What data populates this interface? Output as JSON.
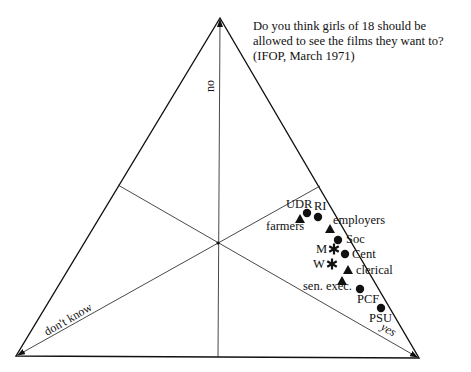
{
  "chart_data": {
    "type": "scatter",
    "subtype": "ternary",
    "title": "Do you think girls of 18 should be allowed to see the films they want to? (IFOP, March 1971)",
    "title_lines": [
      "Do you think girls of 18 should be",
      "allowed to see the films they want to?",
      "(IFOP, March 1971)"
    ],
    "axes": {
      "top": "no",
      "bottom_left": "don't know",
      "bottom_right": "yes"
    },
    "grid": false,
    "legend": null,
    "marker_types": {
      "circle": "political party",
      "triangle": "occupation",
      "asterisk": "sex"
    },
    "points": [
      {
        "label": "UDR",
        "marker": "circle",
        "x": 307,
        "y": 213,
        "lx": 286,
        "ly": 208
      },
      {
        "label": "farmers",
        "marker": "triangle",
        "x": 300,
        "y": 219,
        "lx": 266,
        "ly": 230
      },
      {
        "label": "RI",
        "marker": "circle",
        "x": 318,
        "y": 217,
        "lx": 314,
        "ly": 210
      },
      {
        "label": "employers",
        "marker": "triangle",
        "x": 330,
        "y": 229,
        "lx": 333,
        "ly": 224
      },
      {
        "label": "Soc",
        "marker": "circle",
        "x": 338,
        "y": 240,
        "lx": 346,
        "ly": 243
      },
      {
        "label": "M",
        "marker": "asterisk",
        "x": 334,
        "y": 249,
        "lx": 316,
        "ly": 253
      },
      {
        "label": "Cent",
        "marker": "circle",
        "x": 345,
        "y": 254,
        "lx": 352,
        "ly": 258
      },
      {
        "label": "W",
        "marker": "asterisk",
        "x": 332,
        "y": 264,
        "lx": 313,
        "ly": 268
      },
      {
        "label": "clerical",
        "marker": "triangle",
        "x": 348,
        "y": 270,
        "lx": 356,
        "ly": 274
      },
      {
        "label": "sen. exec.",
        "marker": "triangle",
        "x": 342,
        "y": 281,
        "lx": 303,
        "ly": 290
      },
      {
        "label": "PCF",
        "marker": "circle",
        "x": 360,
        "y": 289,
        "lx": 357,
        "ly": 303
      },
      {
        "label": "PSU",
        "marker": "circle",
        "x": 381,
        "y": 308,
        "lx": 369,
        "ly": 322
      }
    ],
    "triangle_vertices": {
      "top": [
        220,
        18
      ],
      "bottom_left": [
        16,
        356
      ],
      "bottom_right": [
        419,
        358
      ]
    },
    "center": [
      218,
      243
    ]
  }
}
